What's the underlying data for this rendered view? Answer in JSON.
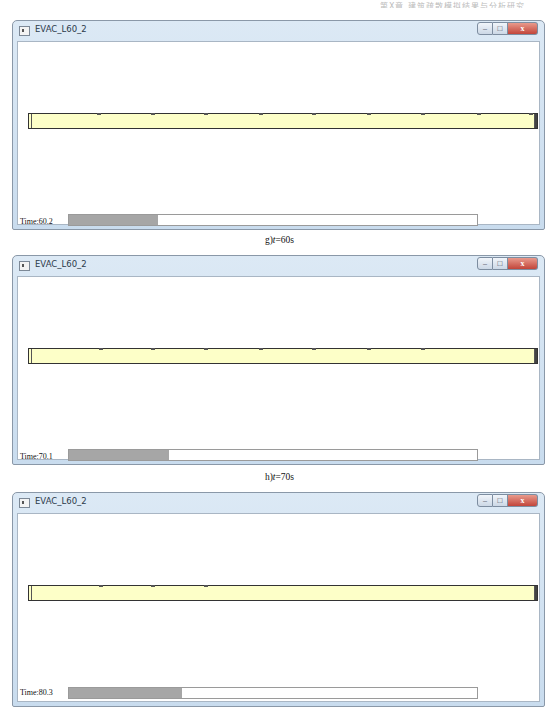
{
  "header_text": "第X章 建筑疏散模拟结果与分析研究",
  "panels": [
    {
      "window_title": "EVAC_L60_2",
      "controls": {
        "minimize": "–",
        "maximize": "□",
        "close": "x"
      },
      "time_label": "Time:60.2",
      "progress_pct": 21.7,
      "caption_prefix": "g)",
      "caption_var": "t",
      "caption_suffix": "=60s",
      "agents_x": [
        68,
        122,
        175,
        230,
        283,
        338,
        392,
        448,
        500
      ]
    },
    {
      "window_title": "EVAC_L60_2",
      "controls": {
        "minimize": "–",
        "maximize": "□",
        "close": "x"
      },
      "time_label": "Time:70.1",
      "progress_pct": 24.6,
      "caption_prefix": "h)",
      "caption_var": "t",
      "caption_suffix": "=70s",
      "agents_x": [
        70,
        122,
        175,
        230,
        283,
        338,
        392
      ]
    },
    {
      "window_title": "EVAC_L60_2",
      "controls": {
        "minimize": "–",
        "maximize": "□",
        "close": "x"
      },
      "time_label": "Time:80.3",
      "progress_pct": 27.8,
      "agents_x": [
        70,
        122,
        175
      ]
    }
  ],
  "colors": {
    "corridor_fill": "#fdffc8",
    "progress_fill": "#a6a6a6",
    "close_button": "#c2453a"
  }
}
